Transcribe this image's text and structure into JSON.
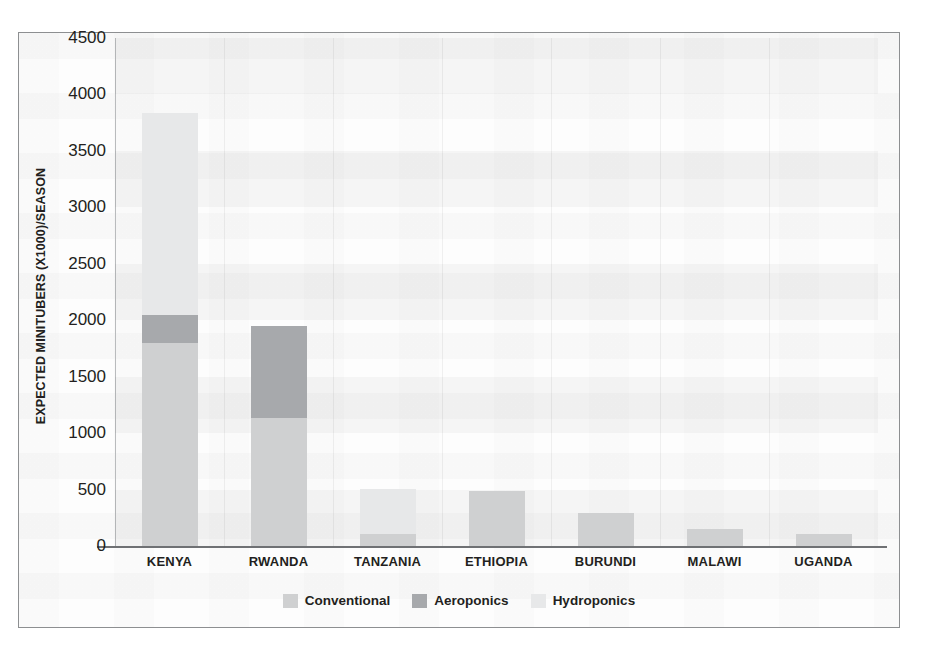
{
  "chart_data": {
    "type": "bar",
    "title": "",
    "subtitle": "",
    "xlabel": "",
    "ylabel": "EXPECTED MINITUBERS (X1000)/SEASON",
    "ylim": [
      0,
      4500
    ],
    "ytick_labels": [
      "0",
      "500",
      "1000",
      "1500",
      "2000",
      "2500",
      "3000",
      "3500",
      "4000",
      "4500"
    ],
    "ytick_values": [
      0,
      500,
      1000,
      1500,
      2000,
      2500,
      3000,
      3500,
      4000,
      4500
    ],
    "grid": "horizontal-bands-and-faint-vertical-gridlines",
    "stacked": true,
    "legend_position": "bottom-center",
    "categories": [
      "KENYA",
      "RWANDA",
      "TANZANIA",
      "ETHIOPIA",
      "BURUNDI",
      "MALAWI",
      "UGANDA"
    ],
    "series": [
      {
        "name": "Conventional",
        "color": "#cfd0d1",
        "values": [
          1800,
          1135,
          105,
          490,
          290,
          155,
          105
        ]
      },
      {
        "name": "Aeroponics",
        "color": "#a7a9ac",
        "values": [
          250,
          815,
          0,
          0,
          0,
          0,
          0
        ]
      },
      {
        "name": "Hydroponics",
        "color": "#e7e8e9",
        "values": [
          1790,
          0,
          400,
          0,
          0,
          0,
          0
        ]
      }
    ],
    "totals": [
      3840,
      1950,
      505,
      490,
      290,
      155,
      105
    ]
  },
  "legend": {
    "items": [
      {
        "label": "Conventional",
        "color": "#cfd0d1"
      },
      {
        "label": "Aeroponics",
        "color": "#a7a9ac"
      },
      {
        "label": "Hydroponics",
        "color": "#e7e8e9"
      }
    ]
  }
}
